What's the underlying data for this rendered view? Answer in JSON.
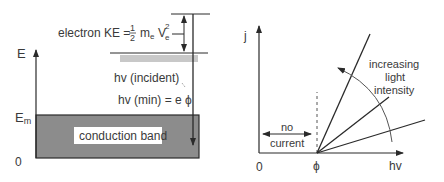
{
  "left_diagram": {
    "axis_label": "E",
    "level_label_main": "E",
    "level_label_sub": "m",
    "origin_label": "0",
    "band_label": "conduction band",
    "ke_label_prefix": "electron KE = ",
    "ke_frac_num": "1",
    "ke_frac_den": "2",
    "ke_m": "m",
    "ke_m_sub": "e",
    "ke_v": "V",
    "ke_v_sub": "e",
    "ke_v_sup": "2",
    "incident_label": "hv (incident)",
    "min_label": "hv (min) = e ϕ",
    "colors": {
      "band_fill": "#8c8c8c",
      "shelf_fill": "#c8c8c8",
      "line": "#2a2a2a"
    }
  },
  "right_diagram": {
    "y_axis_label": "j",
    "x_axis_label": "hv",
    "origin_label": "0",
    "threshold_label": "ϕ",
    "no_current_label_1": "no",
    "no_current_label_2": "current",
    "intensity_label_1": "increasing",
    "intensity_label_2": "light",
    "intensity_label_3": "intensity"
  }
}
